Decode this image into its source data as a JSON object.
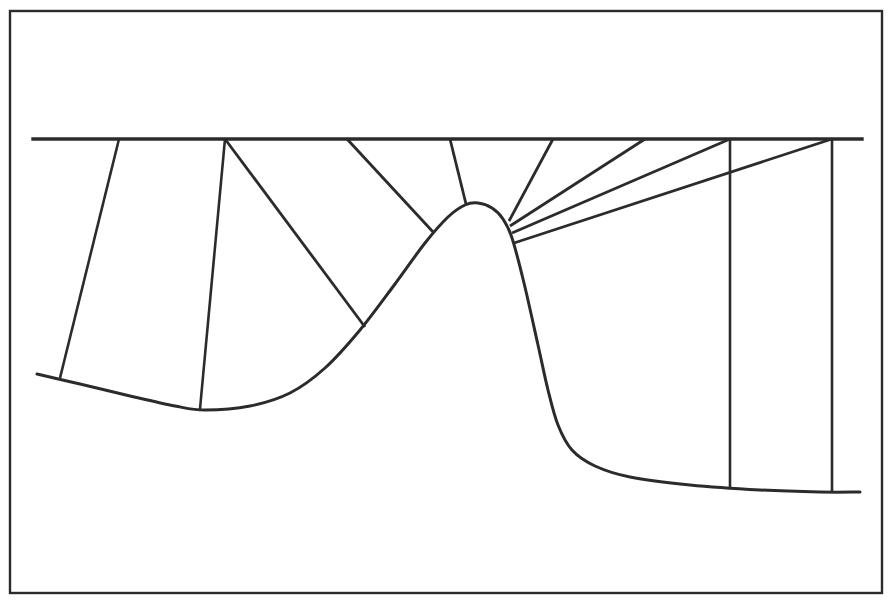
{
  "figure": {
    "width": 892,
    "height": 605,
    "background_color": "#ffffff",
    "ink_color": "#2b2b2b"
  },
  "frame": {
    "name": "outer-border",
    "x": 10,
    "y": 11,
    "width": 872,
    "height": 582,
    "stroke_width": 2.4
  },
  "datum": {
    "label": "horizontal datum line",
    "x_start": 33,
    "x_end": 862,
    "y": 139,
    "stroke_width": 3.4
  },
  "chart_data": {
    "type": "line",
    "xlabel": "",
    "ylabel": "",
    "grid": false,
    "legend": "none",
    "xlim": [
      33,
      862
    ],
    "ylim": [
      139,
      500
    ],
    "note": "y values are screen pixels measured downward; smaller y is higher elevation",
    "series": [
      {
        "name": "profile-curve",
        "points": [
          [
            37,
            374
          ],
          [
            80,
            384
          ],
          [
            130,
            396
          ],
          [
            175,
            406
          ],
          [
            205,
            410
          ],
          [
            250,
            406
          ],
          [
            290,
            393
          ],
          [
            325,
            368
          ],
          [
            360,
            330
          ],
          [
            395,
            284
          ],
          [
            425,
            243
          ],
          [
            448,
            217
          ],
          [
            465,
            205
          ],
          [
            478,
            203
          ],
          [
            492,
            208
          ],
          [
            503,
            219
          ],
          [
            512,
            238
          ],
          [
            524,
            283
          ],
          [
            538,
            345
          ],
          [
            548,
            390
          ],
          [
            558,
            425
          ],
          [
            572,
            450
          ],
          [
            595,
            466
          ],
          [
            630,
            477
          ],
          [
            690,
            485
          ],
          [
            760,
            490
          ],
          [
            820,
            492
          ],
          [
            860,
            492
          ]
        ]
      }
    ],
    "datum_line": {
      "name": "datum",
      "y": 139,
      "x_range": [
        33,
        862
      ]
    },
    "drop_lines": [
      {
        "name": "drop-1",
        "x_top": 119,
        "y_top": 139,
        "x_bottom": 60,
        "y_bottom": 378
      },
      {
        "name": "drop-2",
        "x_top": 225,
        "y_top": 139,
        "x_bottom": 200,
        "y_bottom": 409
      },
      {
        "name": "drop-3",
        "x_top": 730,
        "y_top": 139,
        "x_bottom": 730,
        "y_bottom": 489
      },
      {
        "name": "drop-4",
        "x_top": 832,
        "y_top": 139,
        "x_bottom": 832,
        "y_bottom": 492
      }
    ],
    "ray_lines": [
      {
        "name": "ray-1",
        "x_top": 225,
        "y_top": 139,
        "x_end": 365,
        "y_end": 327
      },
      {
        "name": "ray-2",
        "x_top": 347,
        "y_top": 139,
        "x_end": 434,
        "y_end": 233
      },
      {
        "name": "ray-3",
        "x_top": 450,
        "y_top": 139,
        "x_end": 466,
        "y_end": 204
      },
      {
        "name": "ray-4",
        "x_top": 553,
        "y_top": 139,
        "x_end": 509,
        "y_end": 221
      },
      {
        "name": "ray-5",
        "x_top": 645,
        "y_top": 139,
        "x_end": 510,
        "y_end": 226
      },
      {
        "name": "ray-6",
        "x_top": 730,
        "y_top": 139,
        "x_end": 512,
        "y_end": 233
      },
      {
        "name": "ray-7",
        "x_top": 832,
        "y_top": 139,
        "x_end": 514,
        "y_end": 243
      }
    ]
  }
}
